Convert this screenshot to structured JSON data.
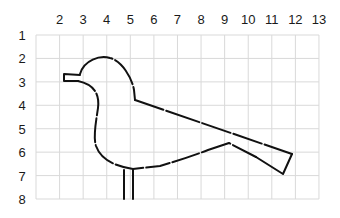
{
  "columns": {
    "labels": [
      "2",
      "3",
      "4",
      "5",
      "6",
      "7",
      "8",
      "9",
      "10",
      "11",
      "12",
      "13"
    ]
  },
  "rows": {
    "labels": [
      "1",
      "2",
      "3",
      "4",
      "5",
      "6",
      "7",
      "8"
    ]
  },
  "figure": {
    "line_style": "dashed"
  }
}
